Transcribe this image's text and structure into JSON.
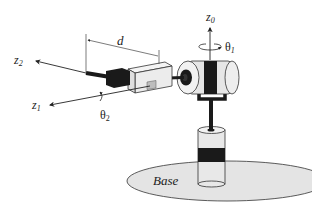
{
  "diagram": {
    "labels": {
      "z0": "z",
      "z0_sub": "0",
      "theta1": "θ",
      "theta1_sub": "1",
      "z1": "z",
      "z1_sub": "1",
      "z2": "z",
      "z2_sub": "2",
      "theta2": "θ",
      "theta2_sub": "2",
      "d": "d",
      "base": "Base"
    },
    "colors": {
      "line": "#222222",
      "dark": "#1a1a1a",
      "light_fill": "#e6e6e6",
      "base_fill": "#e4e4e4",
      "background": "#ffffff"
    }
  }
}
